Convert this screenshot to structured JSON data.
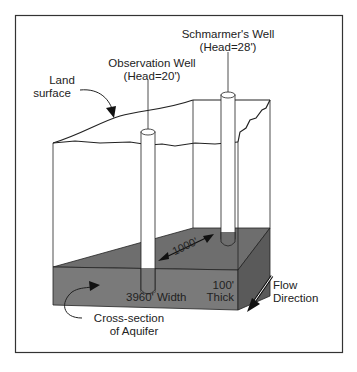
{
  "diagram": {
    "type": "aquifer-well-cross-section",
    "labels": {
      "schmarmer_well_name": "Schmarmer's Well",
      "schmarmer_well_head": "(Head=28')",
      "observation_well_name": "Observation Well",
      "observation_well_head": "(Head=20')",
      "land_surface_line1": "Land",
      "land_surface_line2": "surface",
      "distance": "1000'",
      "width": "3960' Width",
      "thickness_line1": "100'",
      "thickness_line2": "Thick",
      "flow_line1": "Flow",
      "flow_line2": "Direction",
      "cross_section_line1": "Cross-section",
      "cross_section_line2": "of Aquifer"
    },
    "colors": {
      "aquifer_top": "#6e6e6e",
      "aquifer_front": "#7a7a7a",
      "aquifer_side": "#5a5a5a",
      "line": "#222222",
      "well_fill": "#ffffff"
    }
  }
}
